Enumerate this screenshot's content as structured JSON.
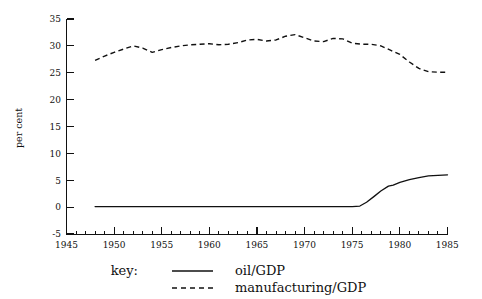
{
  "chart_data": {
    "type": "line",
    "title": "",
    "xlabel": "",
    "ylabel": "per cent",
    "xlim": [
      1945,
      1985
    ],
    "ylim": [
      -5,
      35
    ],
    "grid": false,
    "legend_position": "bottom",
    "legend_title": "key:",
    "x_ticks": [
      "1945",
      "1950",
      "1955",
      "1960",
      "1965",
      "1970",
      "1975",
      "1980",
      "1985"
    ],
    "x_tick_values": [
      1945,
      1950,
      1955,
      1960,
      1965,
      1970,
      1975,
      1980,
      1985
    ],
    "x_minor_step": 1,
    "y_ticks": [
      "-5",
      "0",
      "5",
      "10",
      "15",
      "20",
      "25",
      "30",
      "35"
    ],
    "y_tick_values": [
      -5,
      0,
      5,
      10,
      15,
      20,
      25,
      30,
      35
    ],
    "series": [
      {
        "name": "oil/GDP",
        "style": "solid",
        "color": "#111111",
        "x": [
          1948,
          1950,
          1955,
          1960,
          1965,
          1970,
          1974,
          1975,
          1975.8,
          1976.5,
          1977.3,
          1978,
          1978.8,
          1979.3,
          1980,
          1981,
          1982,
          1983,
          1984,
          1985
        ],
        "values": [
          0.1,
          0.1,
          0.1,
          0.1,
          0.1,
          0.1,
          0.1,
          0.1,
          0.2,
          0.9,
          2.0,
          3.0,
          3.9,
          4.1,
          4.6,
          5.1,
          5.5,
          5.8,
          5.9,
          6.0
        ]
      },
      {
        "name": "manufacturing/GDP",
        "style": "dashed",
        "color": "#111111",
        "x": [
          1948,
          1949,
          1950,
          1951,
          1952,
          1953,
          1954,
          1955,
          1956,
          1957,
          1958,
          1959,
          1960,
          1961,
          1962,
          1963,
          1964,
          1965,
          1966,
          1967,
          1968,
          1969,
          1970,
          1971,
          1972,
          1973,
          1974,
          1975,
          1976,
          1977,
          1978,
          1979,
          1980,
          1981,
          1982,
          1983,
          1984,
          1985
        ],
        "values": [
          27.3,
          28.1,
          28.8,
          29.4,
          30.0,
          29.6,
          28.8,
          29.3,
          29.7,
          30.0,
          30.2,
          30.3,
          30.4,
          30.2,
          30.3,
          30.6,
          31.1,
          31.2,
          30.9,
          31.1,
          31.8,
          32.1,
          31.5,
          30.9,
          30.8,
          31.4,
          31.3,
          30.5,
          30.3,
          30.3,
          30.0,
          29.2,
          28.4,
          27.0,
          25.8,
          25.2,
          25.1,
          25.1
        ]
      }
    ]
  },
  "legend": {
    "label": "key:",
    "entries": [
      {
        "label": "oil/GDP",
        "style": "solid"
      },
      {
        "label": "manufacturing/GDP",
        "style": "dashed"
      }
    ]
  },
  "axis": {
    "y_title": "per cent"
  }
}
